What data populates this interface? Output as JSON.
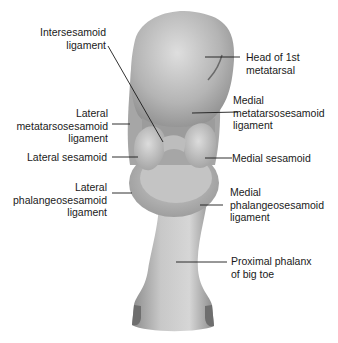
{
  "diagram": {
    "labels": {
      "intersesamoid_ligament": "Intersesamoid\nligament",
      "head_1st_metatarsal": "Head of 1st\nmetatarsal",
      "lateral_metatarsosesamoid_ligament": "Lateral\nmetatarsosesamoid\nligament",
      "medial_metatarsosesamoid_ligament": "Medial\nmetatarsosesamoid\nligament",
      "lateral_sesamoid": "Lateral sesamoid",
      "medial_sesamoid": "Medial sesamoid",
      "lateral_phalangeosesamoid_ligament": "Lateral\nphalangeosesamoid\nligament",
      "medial_phalangeosesamoid_ligament": "Medial\nphalangeosesamoid\nligament",
      "proximal_phalanx": "Proximal phalanx\nof big toe"
    },
    "colors": {
      "bone_light": "#d2d2d2",
      "bone_mid": "#a8a8a8",
      "bone_dark": "#7a7a7a",
      "leader_line": "#1a1a1a",
      "text": "#1a1a1a"
    }
  }
}
